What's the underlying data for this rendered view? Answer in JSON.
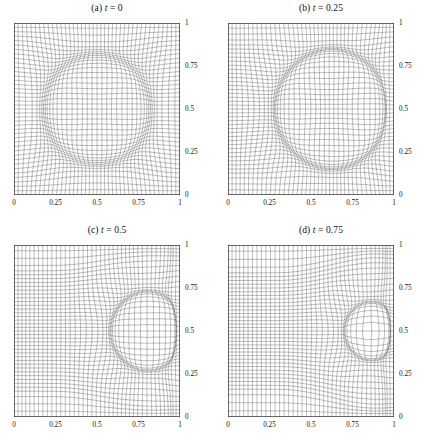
{
  "figure": {
    "background": "#ffffff",
    "line_color": "#3a3a3a",
    "frame_color": "#2b2b2b",
    "panel_count": 4
  },
  "axes": {
    "xticks": [
      "0",
      "0.25",
      "0.5",
      "0.75",
      "1"
    ],
    "xtick_values": [
      0,
      0.25,
      0.5,
      0.75,
      1
    ],
    "yticks": [
      "0",
      "0.25",
      "0.5",
      "0.75",
      "1"
    ],
    "ytick_values": [
      0,
      0.25,
      0.5,
      0.75,
      1
    ],
    "xlim": [
      0,
      1
    ],
    "ylim": [
      0,
      1
    ],
    "ylabel_side": "right",
    "xlabel_side": "bottom",
    "grid": false
  },
  "panels": [
    {
      "key": "a",
      "tag": "(a)",
      "var": "t",
      "eq": "=",
      "value": "0",
      "title": "(a) t = 0",
      "mesh": {
        "nx": 41,
        "ny": 41,
        "concentration": "circle",
        "center_x": 0.5,
        "center_y": 0.5,
        "radius": 0.32,
        "band_strength": 0.72,
        "band_width": 0.055,
        "shear": 0.0,
        "right_wall": 0.0,
        "stretch_x": 0.0
      }
    },
    {
      "key": "b",
      "tag": "(b)",
      "var": "t",
      "eq": "=",
      "value": "0.25",
      "title": "(b) t = 0.25",
      "mesh": {
        "nx": 41,
        "ny": 41,
        "concentration": "circle",
        "center_x": 0.62,
        "center_y": 0.5,
        "radius": 0.34,
        "band_strength": 0.86,
        "band_width": 0.05,
        "shear": 0.3,
        "right_wall": 0.55,
        "stretch_x": 0.28
      }
    },
    {
      "key": "c",
      "tag": "(c)",
      "var": "t",
      "eq": "=",
      "value": "0.5",
      "title": "(c) t = 0.5",
      "mesh": {
        "nx": 41,
        "ny": 41,
        "concentration": "cusp",
        "center_x": 0.8,
        "center_y": 0.5,
        "radius": 0.22,
        "band_strength": 0.92,
        "band_width": 0.042,
        "shear": 0.55,
        "right_wall": 0.85,
        "stretch_x": 0.55
      }
    },
    {
      "key": "d",
      "tag": "(d)",
      "var": "t",
      "eq": "=",
      "value": "0.75",
      "title": "(d) t = 0.75",
      "mesh": {
        "nx": 41,
        "ny": 41,
        "concentration": "cusp",
        "center_x": 0.86,
        "center_y": 0.5,
        "radius": 0.16,
        "band_strength": 0.95,
        "band_width": 0.038,
        "shear": 0.68,
        "right_wall": 0.92,
        "stretch_x": 0.66
      }
    }
  ]
}
